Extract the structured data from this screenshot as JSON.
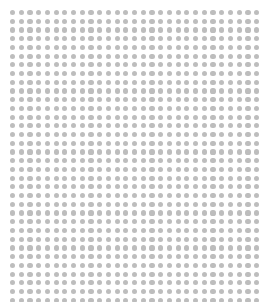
{
  "canvas": {
    "width": 271,
    "height": 302,
    "background_color": "#ffffff",
    "description": "dot-grid-pattern"
  },
  "pattern": {
    "name": "dot-grid",
    "shape": "circle",
    "dot_color": "#b9b9b9",
    "dot_diameter": 5.2,
    "pitch_x": 8.72,
    "pitch_y": 8.72,
    "origin_x": 12.5,
    "origin_y": 12.5,
    "columns": 29,
    "rows": 34,
    "total_dots": 986,
    "opacity": 0.95
  }
}
